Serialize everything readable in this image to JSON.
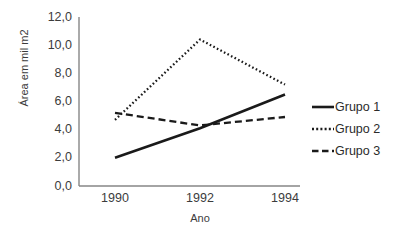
{
  "chart_data": {
    "type": "line",
    "title": "",
    "xlabel": "Ano",
    "ylabel": "Área em mil m2",
    "categories": [
      "1990",
      "1992",
      "1994"
    ],
    "x": [
      1990,
      1992,
      1994
    ],
    "xlim": [
      1990,
      1994
    ],
    "ylim": [
      0.0,
      12.0
    ],
    "yticks": [
      "12,0",
      "10,0",
      "8,0",
      "6,0",
      "4,0",
      "2,0",
      "0,0"
    ],
    "ytick_values": [
      12.0,
      10.0,
      8.0,
      6.0,
      4.0,
      2.0,
      0.0
    ],
    "grid": false,
    "legend_position": "right",
    "series": [
      {
        "name": "Grupo 1",
        "values": [
          2.0,
          4.1,
          6.5
        ],
        "style": "solid",
        "color": "#1a1a1a"
      },
      {
        "name": "Grupo 2",
        "values": [
          4.7,
          10.4,
          7.2
        ],
        "style": "dotted",
        "color": "#1a1a1a"
      },
      {
        "name": "Grupo 3",
        "values": [
          5.2,
          4.3,
          4.9
        ],
        "style": "dashed",
        "color": "#1a1a1a"
      }
    ]
  },
  "axis": {
    "line_color": "#868686"
  }
}
